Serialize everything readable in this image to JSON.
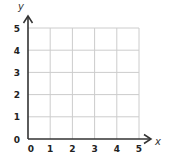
{
  "chart_data": {
    "type": "scatter",
    "title": "",
    "xlabel": "x",
    "ylabel": "y",
    "xlim": [
      0,
      5
    ],
    "ylim": [
      0,
      5
    ],
    "x_ticks": [
      "0",
      "1",
      "2",
      "3",
      "4",
      "5"
    ],
    "y_ticks": [
      "0",
      "1",
      "2",
      "3",
      "4",
      "5"
    ],
    "grid": true,
    "series": [],
    "colors": {
      "grid": "#cccccc",
      "axis": "#333333",
      "text": "#222222"
    }
  }
}
